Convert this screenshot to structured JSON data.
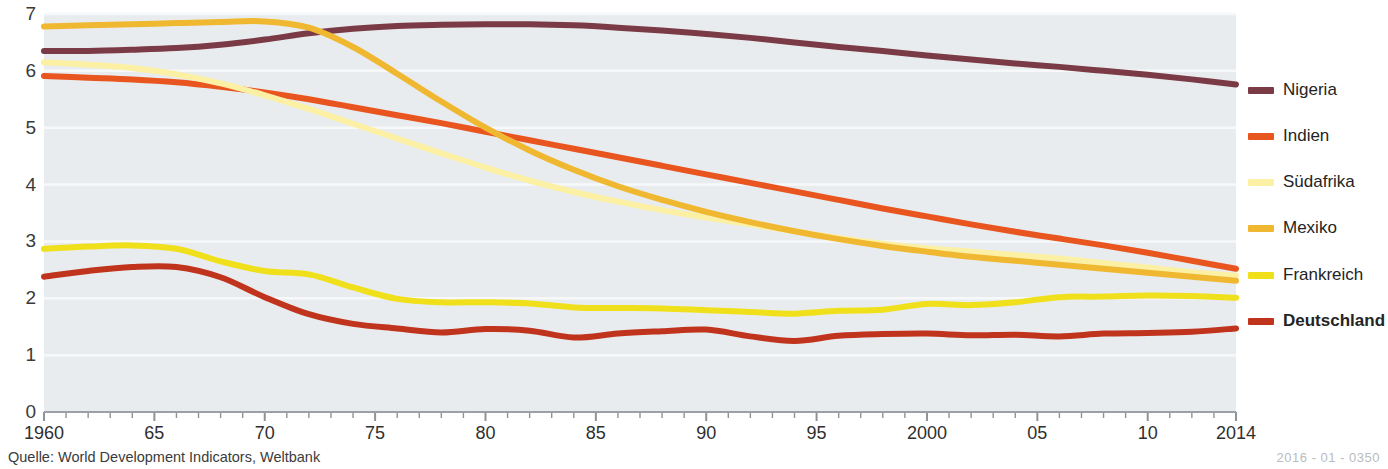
{
  "source_note": "Quelle: World Development Indicators, Weltbank",
  "doc_code": "2016 - 01 - 0350",
  "chart_data": {
    "type": "line",
    "title": "",
    "subtitle": "",
    "xlabel": "",
    "ylabel": "",
    "grid": true,
    "legend_position": "right",
    "plot_background": "#e9ecef",
    "xlim": [
      1960,
      2014
    ],
    "ylim": [
      0,
      7
    ],
    "ytick_labels": [
      "0",
      "1",
      "2",
      "3",
      "4",
      "5",
      "6",
      "7"
    ],
    "ytick_values": [
      0,
      1,
      2,
      3,
      4,
      5,
      6,
      7
    ],
    "xtick_labels": [
      "1960",
      "65",
      "70",
      "75",
      "80",
      "85",
      "90",
      "95",
      "2000",
      "05",
      "10",
      "2014"
    ],
    "xtick_values": [
      1960,
      1965,
      1970,
      1975,
      1980,
      1985,
      1990,
      1995,
      2000,
      2005,
      2010,
      2014
    ],
    "x": [
      1960,
      1962,
      1964,
      1966,
      1968,
      1970,
      1972,
      1974,
      1976,
      1978,
      1980,
      1982,
      1984,
      1986,
      1988,
      1990,
      1992,
      1994,
      1996,
      1998,
      2000,
      2002,
      2004,
      2006,
      2008,
      2010,
      2012,
      2014
    ],
    "series": [
      {
        "name": "Nigeria",
        "color": "#7b3b46",
        "width": 6,
        "bold_label": false,
        "values": [
          6.35,
          6.35,
          6.37,
          6.4,
          6.46,
          6.55,
          6.66,
          6.74,
          6.79,
          6.81,
          6.82,
          6.82,
          6.8,
          6.76,
          6.71,
          6.65,
          6.58,
          6.5,
          6.42,
          6.35,
          6.27,
          6.2,
          6.13,
          6.07,
          6.0,
          5.93,
          5.85,
          5.76
        ]
      },
      {
        "name": "Indien",
        "color": "#e8551f",
        "width": 6,
        "bold_label": false,
        "values": [
          5.91,
          5.88,
          5.85,
          5.8,
          5.72,
          5.62,
          5.5,
          5.36,
          5.22,
          5.08,
          4.93,
          4.78,
          4.63,
          4.48,
          4.33,
          4.18,
          4.03,
          3.88,
          3.73,
          3.58,
          3.44,
          3.3,
          3.17,
          3.05,
          2.93,
          2.8,
          2.66,
          2.52
        ]
      },
      {
        "name": "Südafrika",
        "color": "#fbf0a4",
        "width": 6,
        "bold_label": false,
        "values": [
          6.15,
          6.11,
          6.05,
          5.94,
          5.78,
          5.57,
          5.33,
          5.07,
          4.81,
          4.55,
          4.3,
          4.07,
          3.87,
          3.7,
          3.55,
          3.42,
          3.3,
          3.18,
          3.06,
          2.96,
          2.88,
          2.82,
          2.76,
          2.7,
          2.62,
          2.54,
          2.46,
          2.4
        ]
      },
      {
        "name": "Mexiko",
        "color": "#f0b830",
        "width": 6,
        "bold_label": false,
        "values": [
          6.78,
          6.8,
          6.82,
          6.84,
          6.86,
          6.87,
          6.76,
          6.42,
          5.95,
          5.46,
          5.0,
          4.6,
          4.26,
          3.97,
          3.73,
          3.52,
          3.34,
          3.18,
          3.04,
          2.92,
          2.82,
          2.73,
          2.66,
          2.59,
          2.52,
          2.45,
          2.38,
          2.31
        ]
      },
      {
        "name": "Frankreich",
        "color": "#f0e01c",
        "width": 6,
        "bold_label": false,
        "values": [
          2.87,
          2.91,
          2.93,
          2.87,
          2.65,
          2.48,
          2.42,
          2.19,
          1.99,
          1.93,
          1.93,
          1.91,
          1.84,
          1.83,
          1.82,
          1.79,
          1.76,
          1.73,
          1.78,
          1.8,
          1.9,
          1.88,
          1.93,
          2.02,
          2.03,
          2.05,
          2.04,
          2.01
        ]
      },
      {
        "name": "Deutschland",
        "color": "#c0331c",
        "width": 6,
        "bold_label": true,
        "values": [
          2.38,
          2.48,
          2.55,
          2.55,
          2.37,
          2.02,
          1.72,
          1.55,
          1.47,
          1.4,
          1.46,
          1.43,
          1.31,
          1.38,
          1.42,
          1.45,
          1.33,
          1.25,
          1.34,
          1.37,
          1.38,
          1.35,
          1.36,
          1.33,
          1.38,
          1.39,
          1.41,
          1.47
        ]
      }
    ]
  }
}
